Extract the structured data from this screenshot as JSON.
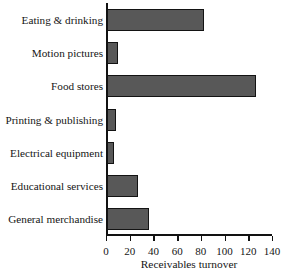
{
  "chart_data": {
    "type": "bar",
    "orientation": "horizontal",
    "title": "",
    "xlabel": "Receivables turnover",
    "ylabel": "",
    "xlim": [
      0,
      140
    ],
    "xticks": [
      0,
      20,
      40,
      60,
      80,
      100,
      120,
      140
    ],
    "grid": false,
    "legend": null,
    "categories": [
      "Eating & drinking",
      "Motion pictures",
      "Food stores",
      "Printing & publishing",
      "Electrical equipment",
      "Educational services",
      "General merchandise"
    ],
    "values": [
      82,
      9,
      126,
      8,
      6,
      26,
      35
    ],
    "bar_color": "#585858",
    "bar_edge_color": "#131313",
    "background_color": "#ffffff",
    "axis_color": "#121212"
  }
}
